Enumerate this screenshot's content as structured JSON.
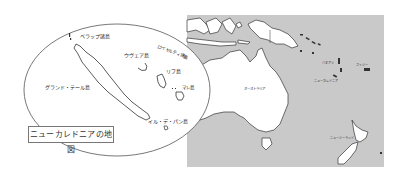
{
  "colors": {
    "ocean": "#c9c9c9",
    "land": "#ffffff",
    "coast": "#333333",
    "ellipse": "#555555"
  },
  "inset": {
    "caption": "ニューカレドニアの地図",
    "labels": {
      "belep": "ベラップ諸島",
      "ouvea": "ウヴェア島",
      "loyalty": "ロイヤルティ諸島",
      "lifou": "リフ島",
      "mare": "マレ島",
      "grande_terre": "グランド・テール島",
      "ile_des_pins": "イル・デ・パン島"
    }
  },
  "regional_map": {
    "labels": {
      "australia": "オーストラリア",
      "vanuatu": "バヌアツ",
      "new_caledonia": "ニューカレドニア",
      "fiji": "フィジー",
      "new_zealand": "ニュージーランド"
    }
  }
}
